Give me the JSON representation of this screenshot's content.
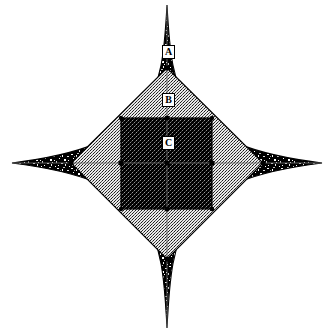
{
  "figure": {
    "background_color": "#ffffff",
    "width": 331,
    "height": 333,
    "center": {
      "x": 167,
      "y": 163
    }
  },
  "labels": [
    {
      "id": "A",
      "text": "A",
      "x": 162,
      "y": 45,
      "region": "astroid-outer-star",
      "description": "outermost concave four-pointed star region"
    },
    {
      "id": "B",
      "text": "B",
      "x": 162,
      "y": 93,
      "region": "diamond-middle",
      "description": "middle diamond region"
    },
    {
      "id": "C",
      "text": "C",
      "x": 162,
      "y": 136,
      "region": "square-inner",
      "description": "inner square region"
    }
  ],
  "regions": [
    {
      "name": "astroid-outer-star",
      "label": "A",
      "fill": "speckle-noise",
      "fill_color": "#111111",
      "stroke_color": "#000000",
      "shape": "astroid",
      "tips": {
        "top": {
          "x": 167,
          "y": 5
        },
        "right": {
          "x": 322,
          "y": 163
        },
        "bottom": {
          "x": 167,
          "y": 328
        },
        "left": {
          "x": 12,
          "y": 163
        }
      }
    },
    {
      "name": "diamond-middle",
      "label": "B",
      "fill": "fine-grid-hatch",
      "fill_color": "#b8b8b8",
      "stroke_color": "#000000",
      "shape": "diamond",
      "vertices": [
        {
          "x": 167,
          "y": 68
        },
        {
          "x": 263,
          "y": 163
        },
        {
          "x": 167,
          "y": 259
        },
        {
          "x": 71,
          "y": 163
        }
      ]
    },
    {
      "name": "square-inner",
      "label": "C",
      "fill": "dense-checker",
      "fill_color": "#2a2a2a",
      "stroke_color": "#000000",
      "shape": "square",
      "bounds": {
        "x1": 121,
        "y1": 118,
        "x2": 212,
        "y2": 209
      }
    }
  ],
  "axes": {
    "horizontal": {
      "y": 163,
      "x1": 12,
      "x2": 322,
      "color": "#555555"
    },
    "vertical": {
      "x": 167,
      "y1": 5,
      "y2": 328,
      "color": "#555555"
    },
    "markers": [
      {
        "x": 167,
        "y": 118
      },
      {
        "x": 167,
        "y": 209
      },
      {
        "x": 121,
        "y": 163
      },
      {
        "x": 212,
        "y": 163
      },
      {
        "x": 167,
        "y": 163
      },
      {
        "x": 121,
        "y": 118
      },
      {
        "x": 212,
        "y": 118
      },
      {
        "x": 121,
        "y": 209
      },
      {
        "x": 212,
        "y": 209
      },
      {
        "x": 71,
        "y": 163
      },
      {
        "x": 263,
        "y": 163
      },
      {
        "x": 167,
        "y": 68
      },
      {
        "x": 167,
        "y": 259
      }
    ]
  },
  "colors": {
    "ink": "#000000",
    "paper": "#ffffff",
    "speckle": "#111111",
    "hatch": "#b8b8b8",
    "checker": "#2a2a2a"
  }
}
